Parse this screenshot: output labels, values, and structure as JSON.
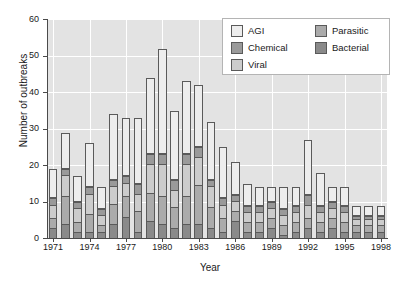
{
  "chart_data": {
    "type": "bar",
    "barmode": "stacked",
    "title": "",
    "xlabel": "Year",
    "ylabel": "Number of outbreaks",
    "ylim": [
      0,
      60
    ],
    "ytick_labels": [
      "0",
      "10",
      "20",
      "30",
      "40",
      "50",
      "60"
    ],
    "ytick_values": [
      0,
      10,
      20,
      30,
      40,
      50,
      60
    ],
    "xtick_labels": [
      "1971",
      "1974",
      "1977",
      "1980",
      "1983",
      "1986",
      "1989",
      "1992",
      "1995",
      "1998"
    ],
    "grid": "horizontal-and-vertical-white",
    "legend_position": "top-right-inside",
    "categories": [
      "1971",
      "1972",
      "1973",
      "1974",
      "1975",
      "1976",
      "1977",
      "1978",
      "1979",
      "1980",
      "1981",
      "1982",
      "1983",
      "1984",
      "1985",
      "1986",
      "1987",
      "1988",
      "1989",
      "1990",
      "1991",
      "1992",
      "1993",
      "1994",
      "1995",
      "1996",
      "1997",
      "1998"
    ],
    "series": [
      {
        "name": "AGI",
        "color": "#ededed",
        "values": [
          8,
          10,
          7,
          12,
          6,
          18,
          16,
          18,
          21,
          29,
          19,
          20,
          17,
          16,
          14,
          9,
          6,
          5,
          4,
          6,
          5,
          15,
          9,
          4,
          5,
          3,
          3,
          3
        ]
      },
      {
        "name": "Chemical",
        "color": "#9a9a9a",
        "values": [
          2,
          2,
          2,
          2,
          2,
          2,
          2,
          3,
          3,
          3,
          3,
          3,
          3,
          2,
          2,
          2,
          2,
          2,
          2,
          2,
          2,
          3,
          2,
          2,
          2,
          1,
          1,
          1
        ]
      },
      {
        "name": "Viral",
        "color": "#cccccc",
        "values": [
          4,
          6,
          4,
          6,
          3,
          5,
          4,
          5,
          8,
          9,
          5,
          9,
          8,
          6,
          4,
          3,
          3,
          3,
          3,
          3,
          3,
          4,
          3,
          3,
          3,
          2,
          2,
          2
        ]
      },
      {
        "name": "Parasitic",
        "color": "#ababab",
        "values": [
          3,
          8,
          3,
          5,
          2,
          6,
          6,
          6,
          8,
          8,
          6,
          8,
          11,
          6,
          4,
          3,
          3,
          3,
          3,
          3,
          3,
          3,
          3,
          3,
          3,
          2,
          2,
          2
        ]
      },
      {
        "name": "Bacterial",
        "color": "#8a8a8a",
        "values": [
          3,
          4,
          2,
          2,
          2,
          4,
          6,
          2,
          5,
          4,
          3,
          4,
          4,
          3,
          2,
          5,
          2,
          2,
          3,
          1,
          2,
          3,
          2,
          3,
          2,
          2,
          2,
          2
        ]
      }
    ],
    "totals": [
      20,
      30,
      18,
      27,
      15,
      35,
      34,
      34,
      45,
      53,
      36,
      44,
      43,
      33,
      26,
      22,
      16,
      15,
      15,
      15,
      15,
      28,
      19,
      15,
      15,
      10,
      10,
      10
    ]
  },
  "legend": {
    "items": [
      {
        "label": "AGI",
        "color": "#ededed"
      },
      {
        "label": "Chemical",
        "color": "#9a9a9a"
      },
      {
        "label": "Viral",
        "color": "#cccccc"
      },
      {
        "label": "Parasitic",
        "color": "#ababab"
      },
      {
        "label": "Bacterial",
        "color": "#8a8a8a"
      }
    ]
  },
  "axes": {
    "x_title": "Year",
    "y_title": "Number of outbreaks"
  }
}
